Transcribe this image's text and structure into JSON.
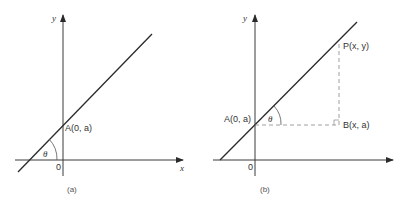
{
  "figure": {
    "panels": [
      {
        "id": "a",
        "caption": "(a)",
        "x_axis_label": "x",
        "y_axis_label": "y",
        "origin_label": "0",
        "angle_label": "θ",
        "point_A_label": "A(0, a)"
      },
      {
        "id": "b",
        "caption": "(b)",
        "y_axis_label": "y",
        "origin_label": "0",
        "angle_label": "θ",
        "point_A_label": "A(0, a)",
        "point_P_label": "P(x, y)",
        "point_B_label": "B(x, a)"
      }
    ],
    "colors": {
      "line": "#2a2a2a",
      "axis": "#3a3a3a",
      "dashed": "#888888",
      "text": "#333333"
    }
  }
}
